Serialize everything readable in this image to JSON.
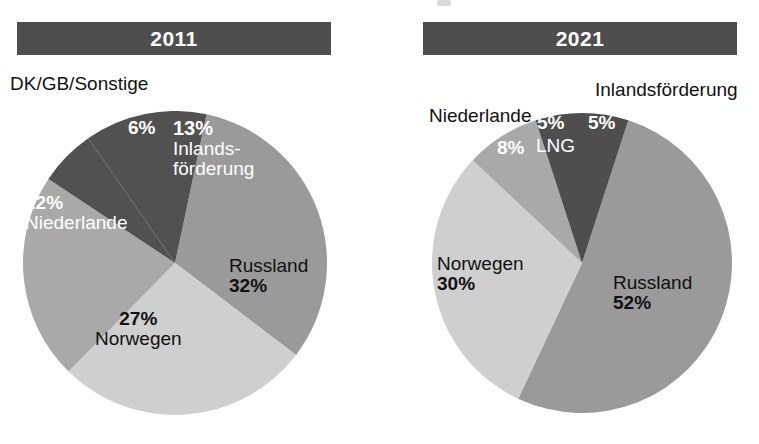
{
  "chart_data": [
    {
      "type": "pie",
      "title": "2011",
      "labels": [
        "Russland",
        "Norwegen",
        "Niederlande",
        "DK/GB/Sonstige",
        "Inlandsförderung"
      ],
      "values": [
        32,
        27,
        22,
        6,
        13
      ],
      "value_labels": [
        "32%",
        "27%",
        "22%",
        "6%",
        "13%"
      ],
      "colors": [
        "#9a9a9a",
        "#cfcfcf",
        "#a9a9a9",
        "#515151",
        "#515151"
      ],
      "legend": "none",
      "grid": false,
      "start_angle_deg": 12,
      "direction": "clockwise"
    },
    {
      "type": "pie",
      "title": "2021",
      "labels": [
        "Russland",
        "Norwegen",
        "Niederlande",
        "LNG",
        "Inlandsförderung"
      ],
      "values": [
        52,
        30,
        8,
        5,
        5
      ],
      "value_labels": [
        "52%",
        "30%",
        "8%",
        "5%",
        "5%"
      ],
      "colors": [
        "#9a9a9a",
        "#cfcfcf",
        "#a9a9a9",
        "#4e4e4e",
        "#4e4e4e"
      ],
      "legend": "none",
      "grid": false,
      "start_angle_deg": 18,
      "direction": "clockwise"
    }
  ],
  "charts": {
    "left": {
      "year": "2011",
      "labels": {
        "dkgb": "DK/GB/Sonstige",
        "six": "6%",
        "inland_pct": "13%",
        "inland_name_1": "Inlands-",
        "inland_name_2": "förderung",
        "niederlande_pct": "22%",
        "niederlande_name": "Niederlande",
        "norwegen_pct": "27%",
        "norwegen_name": "Norwegen",
        "russland_name": "Russland",
        "russland_pct": "32%"
      }
    },
    "right": {
      "year": "2021",
      "labels": {
        "inland_name": "Inlandsförderung",
        "niederlande_name": "Niederlande",
        "niederlande_pct": "8%",
        "lng_pct": "5%",
        "lng_name": "LNG",
        "inland_pct": "5%",
        "norwegen_name": "Norwegen",
        "norwegen_pct": "30%",
        "russland_name": "Russland",
        "russland_pct": "52%"
      }
    }
  },
  "palette": {
    "bar_background": "#4e4e4e",
    "bar_text": "#ffffff",
    "slice_dark": "#515151",
    "slice_medium": "#9a9a9a",
    "slice_medium_light": "#a9a9a9",
    "slice_light": "#cfcfcf",
    "label_dark": "#111111",
    "label_light": "#ffffff",
    "page_background": "#ffffff"
  }
}
